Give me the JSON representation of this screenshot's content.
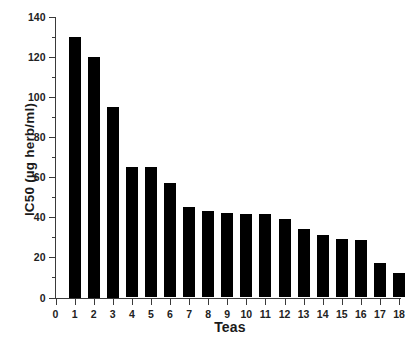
{
  "chart_data": {
    "type": "bar",
    "title": "",
    "xlabel": "Teas",
    "ylabel": "IC50 (µg herb/ml)",
    "categories": [
      "1",
      "2",
      "3",
      "4",
      "5",
      "6",
      "7",
      "8",
      "9",
      "10",
      "11",
      "12",
      "13",
      "14",
      "15",
      "16",
      "17",
      "18"
    ],
    "values": [
      130,
      120,
      95,
      65,
      65,
      57,
      45,
      43,
      42,
      41.5,
      41.5,
      39,
      34,
      31,
      29,
      28.5,
      17,
      12
    ],
    "xlim": [
      0,
      18
    ],
    "ylim": [
      0,
      140
    ],
    "y_major_ticks": [
      0,
      20,
      40,
      60,
      80,
      100,
      120,
      140
    ],
    "y_minor_ticks": [
      10,
      30,
      50,
      70,
      90,
      110,
      130
    ],
    "x_ticks": [
      0,
      1,
      2,
      3,
      4,
      5,
      6,
      7,
      8,
      9,
      10,
      11,
      12,
      13,
      14,
      15,
      16,
      17,
      18
    ],
    "x_tick_labels": [
      "0",
      "1",
      "2",
      "3",
      "4",
      "5",
      "6",
      "7",
      "8",
      "9",
      "10",
      "11",
      "12",
      "13",
      "14",
      "15",
      "16",
      "17",
      "18"
    ],
    "y_tick_labels": [
      "0",
      "20",
      "40",
      "60",
      "80",
      "100",
      "120",
      "140"
    ],
    "grid": false,
    "legend": null,
    "bar_color": "#000000",
    "axis_color": "#3a3a3a",
    "background_color": "#ffffff"
  }
}
